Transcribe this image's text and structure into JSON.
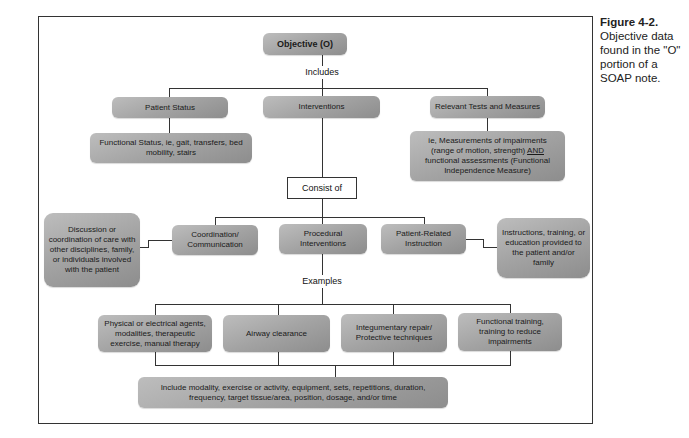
{
  "caption": {
    "label": "Figure 4-2.",
    "text": "Objective data found in the \"O\" portion of a SOAP note."
  },
  "root": {
    "label": "Objective (O)"
  },
  "connectors": {
    "includes": "Includes",
    "consist_of": "Consist of",
    "examples": "Examples"
  },
  "level1": [
    {
      "label": "Patient Status",
      "detail": "Functional Status, ie, gait, transfers, bed mobility, stairs"
    },
    {
      "label": "Interventions"
    },
    {
      "label": "Relevant Tests and Measures",
      "detail_pre": "ie, Measurements of impairments (range of motion, strength) ",
      "detail_emph": "AND",
      "detail_post": " functional assessments (Functional Independence Measure)"
    }
  ],
  "interventions": [
    {
      "label": "Coordination/ Communication",
      "detail": "Discussion or coordination of care with other disciplines, family, or individuals involved with the patient"
    },
    {
      "label": "Procedural Interventions"
    },
    {
      "label": "Patient-Related Instruction",
      "detail": "Instructions, training, or education provided to the patient and/or family"
    }
  ],
  "examples": [
    {
      "label": "Physical or electrical agents, modalities, therapeutic exercise, manual therapy"
    },
    {
      "label": "Airway clearance"
    },
    {
      "label": "Integumentary repair/ Protective techniques"
    },
    {
      "label": "Functional training, training to reduce impairments"
    }
  ],
  "summary": {
    "label": "Include modality, exercise or activity, equipment, sets, repetitions, duration, frequency, target tissue/area, position, dosage, and/or time"
  }
}
